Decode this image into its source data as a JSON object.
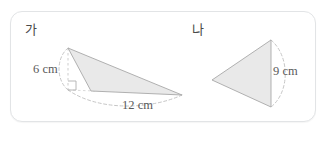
{
  "problem": {
    "figures": [
      {
        "id": "ga",
        "label": "가",
        "shape": "triangle",
        "dimensions": [
          {
            "name": "height",
            "value_label": "6 cm"
          },
          {
            "name": "base",
            "value_label": "12 cm"
          }
        ],
        "has_right_angle_mark": true
      },
      {
        "id": "na",
        "label": "나",
        "shape": "triangle",
        "dimensions": [
          {
            "name": "base",
            "value_label": "9 cm"
          }
        ],
        "has_right_angle_mark": false
      }
    ],
    "answer_field": {
      "open_paren": "(",
      "close_paren": ")",
      "value": ""
    }
  },
  "style": {
    "shape_fill": "#e9e9e9",
    "shape_stroke": "#9a9a9a",
    "dash_stroke": "#b8b8b8",
    "box_border": "#e2e4e6",
    "text_color": "#4a4a4a"
  }
}
